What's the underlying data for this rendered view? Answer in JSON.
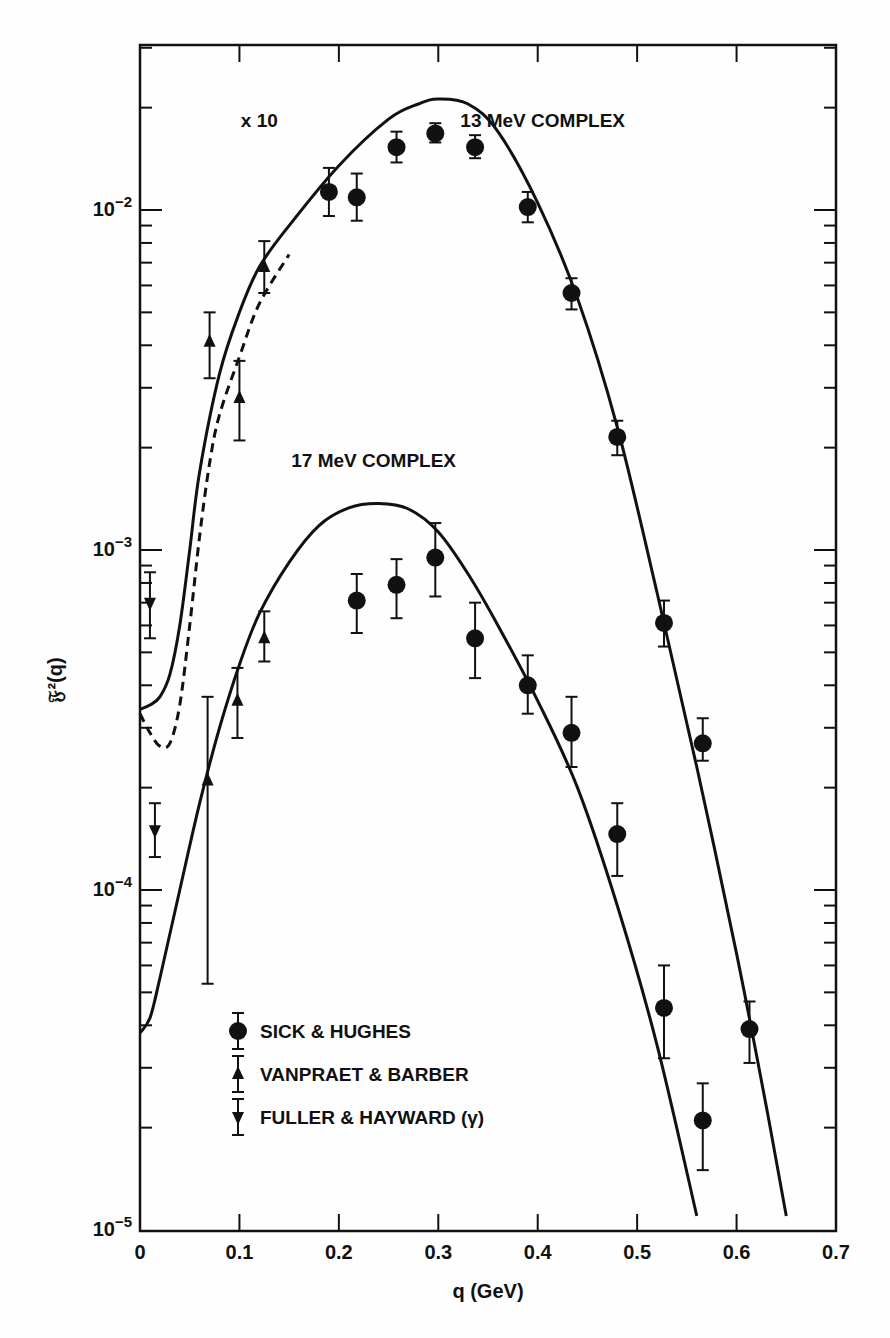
{
  "chart_data": {
    "type": "scatter",
    "title": "",
    "xlabel": "q (GeV)",
    "ylabel": "𝔉²(q)",
    "xscale": "linear",
    "yscale": "log",
    "xlim": [
      0,
      0.7
    ],
    "ylim": [
      1e-05,
      0.0306
    ],
    "x_ticks": [
      "0",
      "0.1",
      "0.2",
      "0.3",
      "0.4",
      "0.5",
      "0.6",
      "0.7"
    ],
    "y_ticks": [
      {
        "value": 0.01,
        "base": "10",
        "exp": "−2"
      },
      {
        "value": 0.001,
        "base": "10",
        "exp": "−3"
      },
      {
        "value": 0.0001,
        "base": "10",
        "exp": "−4"
      },
      {
        "value": 1e-05,
        "base": "10",
        "exp": "−5"
      }
    ],
    "grid": false,
    "annotations": [
      {
        "text": "x 10",
        "q": 0.12,
        "value": 0.0175
      },
      {
        "text": "13 MeV COMPLEX",
        "q": 0.405,
        "value": 0.0175
      },
      {
        "text": "17 MeV COMPLEX",
        "q": 0.235,
        "value": 0.00175
      }
    ],
    "legend": {
      "position": "lower-left",
      "entries": [
        {
          "label": "SICK & HUGHES",
          "marker": "circle"
        },
        {
          "label": "VANPRAET & BARBER",
          "marker": "triangle-up"
        },
        {
          "label": "FULLER & HAYWARD (γ)",
          "marker": "triangle-down"
        }
      ]
    },
    "curves": [
      {
        "name": "13 MeV complex theory (x10)",
        "style": "solid",
        "points": [
          [
            0,
            0.00034
          ],
          [
            0.01,
            0.00035
          ],
          [
            0.02,
            0.00037
          ],
          [
            0.03,
            0.00043
          ],
          [
            0.04,
            0.0006
          ],
          [
            0.05,
            0.001
          ],
          [
            0.06,
            0.0017
          ],
          [
            0.08,
            0.0033
          ],
          [
            0.1,
            0.005
          ],
          [
            0.12,
            0.0068
          ],
          [
            0.15,
            0.009
          ],
          [
            0.2,
            0.0135
          ],
          [
            0.25,
            0.0185
          ],
          [
            0.28,
            0.0205
          ],
          [
            0.3,
            0.0212
          ],
          [
            0.33,
            0.0205
          ],
          [
            0.36,
            0.017
          ],
          [
            0.4,
            0.0105
          ],
          [
            0.44,
            0.0055
          ],
          [
            0.48,
            0.0023
          ],
          [
            0.52,
            0.00075
          ],
          [
            0.56,
            0.00023
          ],
          [
            0.6,
            6.5e-05
          ],
          [
            0.63,
            2.3e-05
          ],
          [
            0.65,
            1.1e-05
          ]
        ]
      },
      {
        "name": "13 MeV complex alternate (dashed)",
        "style": "dashed",
        "points": [
          [
            0,
            0.00033
          ],
          [
            0.01,
            0.00029
          ],
          [
            0.02,
            0.000265
          ],
          [
            0.03,
            0.00027
          ],
          [
            0.04,
            0.00035
          ],
          [
            0.05,
            0.0006
          ],
          [
            0.06,
            0.0011
          ],
          [
            0.07,
            0.0018
          ],
          [
            0.08,
            0.0025
          ],
          [
            0.1,
            0.0037
          ],
          [
            0.12,
            0.0053
          ],
          [
            0.15,
            0.0074
          ]
        ]
      },
      {
        "name": "17 MeV complex theory",
        "style": "solid",
        "points": [
          [
            0,
            3.8e-05
          ],
          [
            0.01,
            4.2e-05
          ],
          [
            0.02,
            5.5e-05
          ],
          [
            0.04,
            0.0001
          ],
          [
            0.06,
            0.00018
          ],
          [
            0.08,
            0.0003
          ],
          [
            0.1,
            0.00046
          ],
          [
            0.12,
            0.00065
          ],
          [
            0.15,
            0.00092
          ],
          [
            0.18,
            0.00118
          ],
          [
            0.21,
            0.00133
          ],
          [
            0.24,
            0.00137
          ],
          [
            0.27,
            0.00132
          ],
          [
            0.3,
            0.00113
          ],
          [
            0.33,
            0.00085
          ],
          [
            0.36,
            0.0006
          ],
          [
            0.4,
            0.00036
          ],
          [
            0.44,
            0.0002
          ],
          [
            0.48,
            9e-05
          ],
          [
            0.52,
            3.5e-05
          ],
          [
            0.56,
            1.1e-05
          ]
        ]
      }
    ],
    "series": [
      {
        "name": "SICK & HUGHES",
        "marker": "circle",
        "complex": "13 MeV (x10)",
        "points": [
          {
            "q": 0.19,
            "v": 0.0113,
            "lo": 0.0096,
            "hi": 0.0133
          },
          {
            "q": 0.218,
            "v": 0.0109,
            "lo": 0.0093,
            "hi": 0.0128
          },
          {
            "q": 0.258,
            "v": 0.0153,
            "lo": 0.0138,
            "hi": 0.017
          },
          {
            "q": 0.297,
            "v": 0.0168,
            "lo": 0.0158,
            "hi": 0.018
          },
          {
            "q": 0.337,
            "v": 0.0153,
            "lo": 0.0142,
            "hi": 0.0166
          },
          {
            "q": 0.39,
            "v": 0.0102,
            "lo": 0.0092,
            "hi": 0.0113
          },
          {
            "q": 0.434,
            "v": 0.0057,
            "lo": 0.0051,
            "hi": 0.0063
          },
          {
            "q": 0.48,
            "v": 0.00215,
            "lo": 0.0019,
            "hi": 0.0024
          },
          {
            "q": 0.527,
            "v": 0.00061,
            "lo": 0.00052,
            "hi": 0.00071
          },
          {
            "q": 0.566,
            "v": 0.00027,
            "lo": 0.00024,
            "hi": 0.00032
          },
          {
            "q": 0.613,
            "v": 3.9e-05,
            "lo": 3.1e-05,
            "hi": 4.7e-05
          }
        ]
      },
      {
        "name": "VANPRAET & BARBER",
        "marker": "triangle-up",
        "complex": "13 MeV (x10)",
        "points": [
          {
            "q": 0.07,
            "v": 0.0041,
            "lo": 0.0032,
            "hi": 0.005
          },
          {
            "q": 0.1,
            "v": 0.0028,
            "lo": 0.0021,
            "hi": 0.0036
          },
          {
            "q": 0.125,
            "v": 0.0068,
            "lo": 0.0057,
            "hi": 0.0081
          }
        ]
      },
      {
        "name": "FULLER & HAYWARD (γ)",
        "marker": "triangle-down",
        "complex": "13 MeV (x10)",
        "points": [
          {
            "q": 0.01,
            "v": 0.0007,
            "lo": 0.00055,
            "hi": 0.00086
          },
          {
            "q": 0.015,
            "v": 0.00015,
            "lo": 0.000125,
            "hi": 0.00018
          }
        ]
      },
      {
        "name": "SICK & HUGHES",
        "marker": "circle",
        "complex": "17 MeV",
        "points": [
          {
            "q": 0.218,
            "v": 0.00071,
            "lo": 0.00057,
            "hi": 0.00085
          },
          {
            "q": 0.258,
            "v": 0.00079,
            "lo": 0.00063,
            "hi": 0.00094
          },
          {
            "q": 0.297,
            "v": 0.00095,
            "lo": 0.00073,
            "hi": 0.0012
          },
          {
            "q": 0.337,
            "v": 0.00055,
            "lo": 0.00042,
            "hi": 0.0007
          },
          {
            "q": 0.39,
            "v": 0.0004,
            "lo": 0.00033,
            "hi": 0.00049
          },
          {
            "q": 0.434,
            "v": 0.00029,
            "lo": 0.00023,
            "hi": 0.00037
          },
          {
            "q": 0.48,
            "v": 0.000146,
            "lo": 0.00011,
            "hi": 0.00018
          },
          {
            "q": 0.527,
            "v": 4.5e-05,
            "lo": 3.2e-05,
            "hi": 6e-05
          },
          {
            "q": 0.566,
            "v": 2.1e-05,
            "lo": 1.5e-05,
            "hi": 2.7e-05
          }
        ]
      },
      {
        "name": "VANPRAET & BARBER",
        "marker": "triangle-up",
        "complex": "17 MeV",
        "points": [
          {
            "q": 0.068,
            "v": 0.00021,
            "lo": 5.3e-05,
            "hi": 0.00037
          },
          {
            "q": 0.098,
            "v": 0.00036,
            "lo": 0.00028,
            "hi": 0.00045
          },
          {
            "q": 0.125,
            "v": 0.00055,
            "lo": 0.00047,
            "hi": 0.00066
          }
        ]
      }
    ]
  }
}
